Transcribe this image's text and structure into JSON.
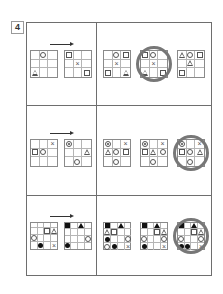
{
  "problem": {
    "number": "4"
  },
  "rows": [
    {
      "size": 3,
      "example_before": [
        [
          0,
          1,
          "circle"
        ],
        [
          2,
          0,
          "triangle"
        ]
      ],
      "example_after": [
        [
          0,
          0,
          "square"
        ],
        [
          1,
          1,
          "cross"
        ],
        [
          2,
          2,
          "square"
        ]
      ],
      "options": [
        [
          [
            0,
            1,
            "circle"
          ],
          [
            0,
            2,
            "square"
          ],
          [
            1,
            1,
            "cross"
          ],
          [
            2,
            0,
            "square"
          ],
          [
            2,
            2,
            "triangle"
          ]
        ],
        [
          [
            0,
            0,
            "square"
          ],
          [
            0,
            1,
            "circle"
          ],
          [
            1,
            1,
            "cross"
          ],
          [
            2,
            0,
            "triangle"
          ],
          [
            2,
            2,
            "square"
          ]
        ],
        [
          [
            0,
            0,
            "triangle"
          ],
          [
            0,
            1,
            "circle"
          ],
          [
            0,
            2,
            "square"
          ],
          [
            1,
            1,
            "triangle"
          ],
          [
            2,
            0,
            "square"
          ]
        ]
      ],
      "selected_option": 1
    },
    {
      "size": 3,
      "example_before": [
        [
          0,
          2,
          "cross"
        ],
        [
          1,
          0,
          "square"
        ],
        [
          1,
          1,
          "circle"
        ]
      ],
      "example_after": [
        [
          0,
          0,
          "target"
        ],
        [
          1,
          2,
          "triangle"
        ],
        [
          2,
          1,
          "circle"
        ]
      ],
      "options": [
        [
          [
            0,
            0,
            "target"
          ],
          [
            0,
            2,
            "cross"
          ],
          [
            1,
            0,
            "triangle"
          ],
          [
            1,
            1,
            "circle"
          ],
          [
            1,
            2,
            "square"
          ],
          [
            2,
            1,
            "circle"
          ]
        ],
        [
          [
            0,
            0,
            "target"
          ],
          [
            0,
            2,
            "cross"
          ],
          [
            1,
            0,
            "square"
          ],
          [
            1,
            1,
            "triangle"
          ],
          [
            1,
            2,
            "circle"
          ],
          [
            2,
            1,
            "circle"
          ]
        ],
        [
          [
            0,
            0,
            "target"
          ],
          [
            0,
            2,
            "cross"
          ],
          [
            1,
            0,
            "square"
          ],
          [
            1,
            1,
            "circle"
          ],
          [
            1,
            2,
            "triangle"
          ],
          [
            2,
            1,
            "circle"
          ]
        ]
      ],
      "selected_option": 2
    },
    {
      "size": 4,
      "example_before": [
        [
          1,
          2,
          "square"
        ],
        [
          1,
          3,
          "triangle"
        ],
        [
          2,
          0,
          "circle"
        ],
        [
          3,
          1,
          "fcircle"
        ],
        [
          3,
          3,
          "cross"
        ]
      ],
      "example_after": [
        [
          0,
          0,
          "fsquare"
        ],
        [
          0,
          2,
          "ftriangle"
        ],
        [
          2,
          3,
          "circle"
        ],
        [
          3,
          0,
          "fcircle"
        ]
      ],
      "options": [
        [
          [
            0,
            0,
            "fsquare"
          ],
          [
            0,
            2,
            "ftriangle"
          ],
          [
            1,
            0,
            "triangle"
          ],
          [
            1,
            1,
            "square"
          ],
          [
            2,
            0,
            "fcircle"
          ],
          [
            2,
            3,
            "circle"
          ],
          [
            3,
            0,
            "circle"
          ],
          [
            3,
            1,
            "fcircle"
          ],
          [
            3,
            3,
            "cross"
          ]
        ],
        [
          [
            0,
            0,
            "fsquare"
          ],
          [
            0,
            2,
            "ftriangle"
          ],
          [
            1,
            2,
            "square"
          ],
          [
            1,
            3,
            "triangle"
          ],
          [
            2,
            0,
            "circle"
          ],
          [
            2,
            3,
            "circle"
          ],
          [
            3,
            0,
            "fcircle"
          ],
          [
            3,
            3,
            "cross"
          ]
        ],
        [
          [
            0,
            0,
            "fsquare"
          ],
          [
            0,
            2,
            "ftriangle"
          ],
          [
            1,
            2,
            "square"
          ],
          [
            1,
            3,
            "triangle"
          ],
          [
            2,
            0,
            "circle"
          ],
          [
            2,
            3,
            "circle"
          ],
          [
            3,
            0,
            "fcircle"
          ],
          [
            3,
            1,
            "fcircle"
          ],
          [
            3,
            3,
            "cross"
          ]
        ]
      ],
      "selected_option": 2
    }
  ],
  "symbols": {
    "cross": "×"
  },
  "colors": {
    "frame": "#6e6e6e",
    "ring": "#777777",
    "filled": "#111111"
  }
}
